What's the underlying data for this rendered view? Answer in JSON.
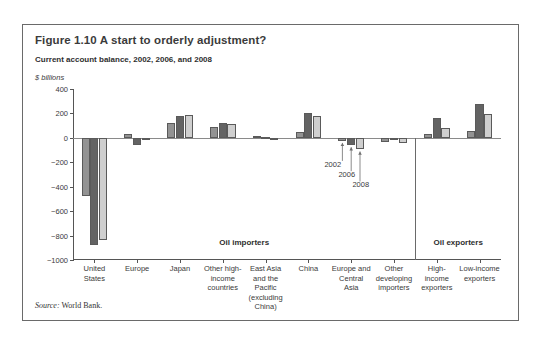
{
  "figure": {
    "title": "Figure 1.10  A start to orderly adjustment?",
    "subtitle": "Current account balance, 2002, 2006, and 2008",
    "unit": "$ billions",
    "source_label": "Source:",
    "source_text": " World Bank."
  },
  "chart_data": {
    "type": "bar",
    "title": "Current account balance, 2002, 2006, and 2008",
    "xlabel": "",
    "ylabel": "$ billions",
    "ylim": [
      -1000,
      400
    ],
    "yticks": [
      400,
      200,
      0,
      -200,
      -400,
      -600,
      -800,
      -1000
    ],
    "ytick_labels": [
      "400",
      "200",
      "0",
      "−200",
      "−400",
      "−600",
      "−800",
      "−1000"
    ],
    "grid": false,
    "legend_position": "inline-annotation",
    "categories": [
      "United\nStates",
      "Europe",
      "Japan",
      "Other high-\nincome\ncountries",
      "East Asia\nand the\nPacific\n(excluding\nChina)",
      "China",
      "Europe and\nCentral\nAsia",
      "Other\ndeveloping\nimporters",
      "High-\nincome\nexporters",
      "Low-income\nexporters"
    ],
    "series": [
      {
        "name": "2002",
        "color": "#939393",
        "values": [
          -480,
          35,
          120,
          85,
          15,
          45,
          -25,
          -35,
          35,
          55
        ]
      },
      {
        "name": "2006",
        "color": "#636363",
        "values": [
          -875,
          -55,
          180,
          120,
          5,
          205,
          -60,
          -5,
          160,
          280
        ]
      },
      {
        "name": "2008",
        "color": "#cfcfcf",
        "values": [
          -840,
          -20,
          185,
          110,
          0,
          180,
          -95,
          -45,
          80,
          195
        ]
      }
    ],
    "annotations": [
      {
        "text": "2002",
        "points_to": "Europe and Central Asia / 2002 bar"
      },
      {
        "text": "2006",
        "points_to": "Europe and Central Asia / 2006 bar"
      },
      {
        "text": "2008",
        "points_to": "Europe and Central Asia / 2008 bar"
      }
    ],
    "group_labels": [
      {
        "text": "Oil importers",
        "spans": "United States – Other developing importers"
      },
      {
        "text": "Oil exporters",
        "spans": "High-income exporters – Low-income exporters"
      }
    ]
  }
}
